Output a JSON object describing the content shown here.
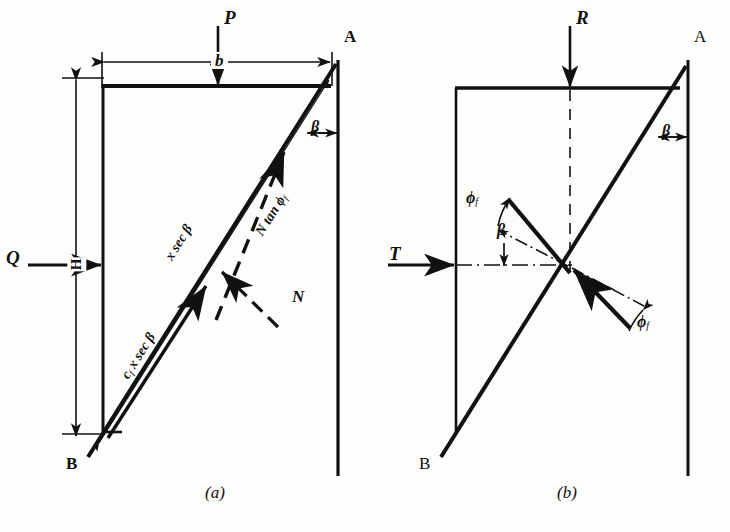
{
  "figure": {
    "title_a": "(a)",
    "title_b": "(b)"
  },
  "panel_a": {
    "caption": "(a)",
    "vertex_top": "A",
    "vertex_bottom": "B",
    "load_vertical": "P",
    "load_horizontal": "Q",
    "dim_width": "b",
    "dim_height": "H",
    "angle": "β",
    "slip_length": "x sec β",
    "force_friction": "N tan ϕ",
    "force_friction_sub": "f",
    "force_normal": "N",
    "force_cohesion_prefix": "c",
    "force_cohesion_sub": "f",
    "force_cohesion_rest": " x sec β"
  },
  "panel_b": {
    "caption": "(b)",
    "vertex_top": "A",
    "vertex_bottom": "B",
    "load_vertical": "R",
    "load_horizontal": "T",
    "angle_beta_top": "β",
    "angle_beta_mid": "β",
    "angle_phi_left": "ϕ",
    "angle_phi_left_sub": "f",
    "angle_phi_right": "ϕ",
    "angle_phi_right_sub": "f"
  },
  "colors": {
    "ink": "#111111",
    "paper": "#fdfdfb"
  }
}
